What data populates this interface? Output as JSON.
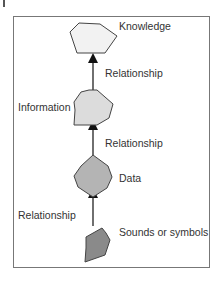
{
  "diagram": {
    "nodes": [
      {
        "id": "knowledge",
        "label": "Knowledge",
        "fill": "#f0f0f0"
      },
      {
        "id": "information",
        "label": "Information",
        "fill": "#dcdcdc"
      },
      {
        "id": "data",
        "label": "Data",
        "fill": "#b4b4b4"
      },
      {
        "id": "sounds",
        "label": "Sounds or symbols",
        "fill": "#8c8c8c"
      }
    ],
    "edges": [
      {
        "from": "information",
        "to": "knowledge",
        "label": "Relationship"
      },
      {
        "from": "data",
        "to": "information",
        "label": "Relationship"
      },
      {
        "from": "sounds",
        "to": "data",
        "label": "Relationship"
      }
    ],
    "colors": {
      "stroke": "#444444",
      "frame": "#777777"
    }
  }
}
